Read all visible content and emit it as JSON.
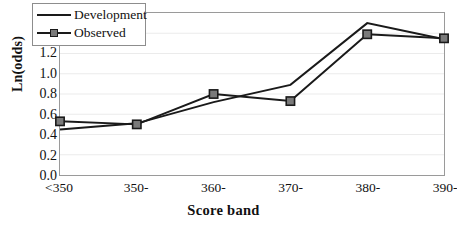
{
  "chart_data": {
    "type": "line",
    "title": "",
    "xlabel": "Score band",
    "ylabel": "Ln(odds)",
    "categories": [
      "<350",
      "350-",
      "360-",
      "370-",
      "380-",
      "390-"
    ],
    "ylim": [
      0.0,
      1.6
    ],
    "yticks": [
      "1.6",
      "1.4",
      "1.2",
      "1.0",
      "0.8",
      "0.6",
      "0.4",
      "0.2",
      "0.0"
    ],
    "ytick_values": [
      1.6,
      1.4,
      1.2,
      1.0,
      0.8,
      0.6,
      0.4,
      0.2,
      0.0
    ],
    "grid": true,
    "legend_position": "top-left",
    "series": [
      {
        "name": "Development",
        "marker": "none",
        "color": "#1a1a1a",
        "values": [
          0.45,
          0.51,
          0.72,
          0.89,
          1.5,
          1.34
        ]
      },
      {
        "name": "Observed",
        "marker": "square",
        "color": "#1a1a1a",
        "marker_fill": "#7a7a7a",
        "values": [
          0.53,
          0.5,
          0.8,
          0.73,
          1.39,
          1.35
        ]
      }
    ]
  },
  "axis": {
    "y_title": "Ln(odds)",
    "x_title": "Score band"
  },
  "legend": {
    "items": [
      {
        "label": "Development"
      },
      {
        "label": "Observed"
      }
    ]
  },
  "colors": {
    "line": "#1a1a1a",
    "marker_fill": "#7a7a7a",
    "grid": "#ebebeb",
    "frame": "#9a9a9a",
    "background": "#ffffff"
  }
}
